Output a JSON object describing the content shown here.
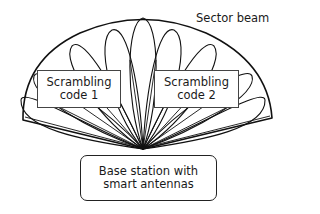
{
  "diagram": {
    "title_label": "Sector beam",
    "boxes": [
      {
        "line1": "Scrambling",
        "line2": "code 1"
      },
      {
        "line1": "Scrambling",
        "line2": "code 2"
      }
    ],
    "base_station": {
      "line1": "Base station with",
      "line2": "smart antennas"
    },
    "stroke_color": "#111111"
  }
}
